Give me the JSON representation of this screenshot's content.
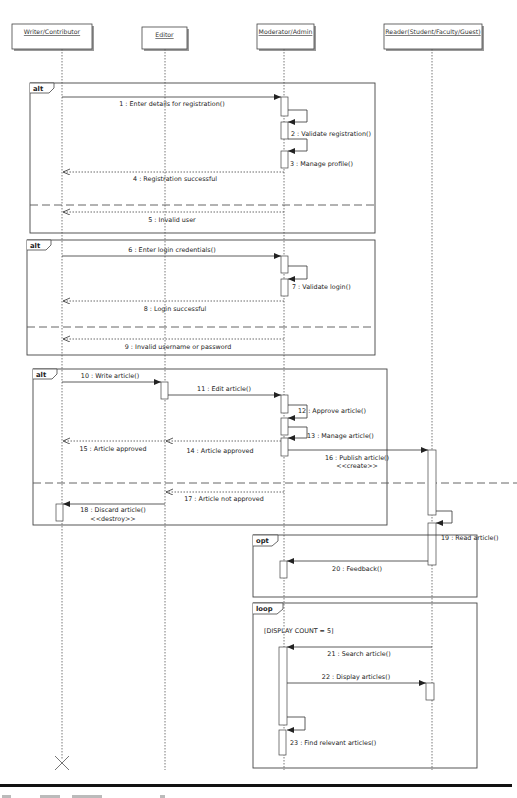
{
  "diagram": {
    "type": "uml-sequence",
    "lifelines": [
      {
        "id": "writer",
        "label": "Writer/Contributor",
        "x": 62,
        "box": [
          12,
          24,
          80,
          25
        ]
      },
      {
        "id": "editor",
        "label": "Editor",
        "x": 165,
        "box": [
          142,
          27,
          45,
          22
        ]
      },
      {
        "id": "moderator",
        "label": "Moderator/Admin",
        "x": 284,
        "box": [
          257,
          24,
          57,
          25
        ]
      },
      {
        "id": "reader",
        "label": "Reader(Student/Faculty/Guest)",
        "x": 432,
        "box": [
          384,
          24,
          98,
          25
        ]
      }
    ],
    "fragments": [
      {
        "id": "alt-registration",
        "operator": "alt",
        "box": [
          30,
          83,
          345,
          150
        ],
        "divider_y": 205
      },
      {
        "id": "alt-login",
        "operator": "alt",
        "box": [
          27,
          240,
          348,
          115
        ],
        "divider_y": 327
      },
      {
        "id": "alt-article",
        "operator": "alt",
        "box": [
          33,
          369,
          354,
          156
        ],
        "divider_y": 483
      },
      {
        "id": "opt-feedback",
        "operator": "opt",
        "box": [
          253,
          535,
          224,
          62
        ]
      },
      {
        "id": "loop-display",
        "operator": "loop",
        "box": [
          253,
          603,
          224,
          165
        ],
        "guard": "[DISPLAY COUNT = 5]"
      }
    ],
    "messages": [
      {
        "n": 1,
        "label": "1 : Enter details for registration()",
        "from": "writer",
        "to": "moderator",
        "y": 97,
        "kind": "sync"
      },
      {
        "n": 2,
        "label": "2 : Validate registration()",
        "from": "moderator",
        "to": "moderator",
        "y": 110,
        "kind": "self"
      },
      {
        "n": 3,
        "label": "3 : Manage profile()",
        "from": "moderator",
        "to": "moderator",
        "y": 139,
        "kind": "self"
      },
      {
        "n": 4,
        "label": "4 : Registration successful",
        "from": "moderator",
        "to": "writer",
        "y": 171,
        "kind": "reply"
      },
      {
        "n": 5,
        "label": "5 : Invalid user",
        "from": "moderator",
        "to": "writer",
        "y": 211,
        "kind": "reply"
      },
      {
        "n": 6,
        "label": "6 : Enter login credentials()",
        "from": "writer",
        "to": "moderator",
        "y": 256,
        "kind": "sync"
      },
      {
        "n": 7,
        "label": "7 : Validate login()",
        "from": "moderator",
        "to": "moderator",
        "y": 266,
        "kind": "self"
      },
      {
        "n": 8,
        "label": "8 : Login successful",
        "from": "moderator",
        "to": "writer",
        "y": 301,
        "kind": "reply"
      },
      {
        "n": 9,
        "label": "9 : Invalid username or password",
        "from": "moderator",
        "to": "writer",
        "y": 339,
        "kind": "reply"
      },
      {
        "n": 10,
        "label": "10 : Write article()",
        "from": "writer",
        "to": "editor",
        "y": 382,
        "kind": "sync"
      },
      {
        "n": 11,
        "label": "11 : Edit article()",
        "from": "editor",
        "to": "moderator",
        "y": 395,
        "kind": "sync"
      },
      {
        "n": 12,
        "label": "12 : Approve article()",
        "from": "moderator",
        "to": "moderator",
        "y": 405,
        "kind": "self"
      },
      {
        "n": 13,
        "label": "13 : Manage article()",
        "from": "moderator",
        "to": "moderator",
        "y": 427,
        "kind": "self"
      },
      {
        "n": 14,
        "label": "14 : Article approved",
        "from": "moderator",
        "to": "editor",
        "y": 440,
        "kind": "reply"
      },
      {
        "n": 15,
        "label": "15 : Article approved",
        "from": "editor",
        "to": "writer",
        "y": 440,
        "kind": "reply"
      },
      {
        "n": 16,
        "label": "16 : Publish article()",
        "stereotype": "<<create>>",
        "from": "moderator",
        "to": "reader",
        "y": 450,
        "kind": "sync"
      },
      {
        "n": 17,
        "label": "17 : Article not approved",
        "from": "moderator",
        "to": "editor",
        "y": 492,
        "kind": "reply"
      },
      {
        "n": 18,
        "label": "18 : Discard article()",
        "stereotype": "<<destroy>>",
        "from": "editor",
        "to": "writer",
        "y": 504,
        "kind": "sync"
      },
      {
        "n": 19,
        "label": "19 : Read article()",
        "from": "reader",
        "to": "reader",
        "y": 511,
        "kind": "self"
      },
      {
        "n": 20,
        "label": "20 : Feedback()",
        "from": "reader",
        "to": "moderator",
        "y": 561,
        "kind": "sync"
      },
      {
        "n": 21,
        "label": "21 : Search article()",
        "from": "reader",
        "to": "moderator",
        "y": 647,
        "kind": "sync"
      },
      {
        "n": 22,
        "label": "22 : Display articles()",
        "from": "moderator",
        "to": "reader",
        "y": 683,
        "kind": "sync"
      },
      {
        "n": 23,
        "label": "23 : Find relevant articles()",
        "from": "moderator",
        "to": "moderator",
        "y": 717,
        "kind": "self"
      }
    ],
    "destroy_marker": {
      "lifeline": "writer",
      "x": 62,
      "y": 763
    },
    "caption": {
      "visible": "truncated"
    }
  },
  "labels": {
    "writer": "Writer/Contributor",
    "editor": "Editor",
    "moderator": "Moderator/Admin",
    "reader": "Reader(Student/Faculty/Guest)",
    "alt": "alt",
    "opt": "opt",
    "loop": "loop",
    "guard": "[DISPLAY COUNT = 5]",
    "m1": "1 : Enter details for registration()",
    "m2": "2 : Validate registration()",
    "m3": "3 : Manage profile()",
    "m4": "4 : Registration successful",
    "m5": "5 : Invalid user",
    "m6": "6 : Enter login credentials()",
    "m7": "7 : Validate login()",
    "m8": "8 : Login successful",
    "m9": "9 : Invalid username or password",
    "m10": "10 : Write article()",
    "m11": "11 : Edit article()",
    "m12": "12 : Approve article()",
    "m13": "13 : Manage article()",
    "m14": "14 : Article approved",
    "m15": "15 : Article approved",
    "m16": "16 : Publish article()",
    "m16s": "<<create>>",
    "m17": "17 : Article not approved",
    "m18": "18 : Discard article()",
    "m18s": "<<destroy>>",
    "m19": "19 : Read article()",
    "m20": "20 : Feedback()",
    "m21": "21 : Search article()",
    "m22": "22 : Display articles()",
    "m23": "23 : Find relevant articles()"
  },
  "colors": {
    "line": "#333333",
    "dotted": "#555555",
    "frame": "#444444",
    "box_fill": "#ffffff",
    "shadow": "#9a9a9a",
    "rule": "#111111"
  }
}
